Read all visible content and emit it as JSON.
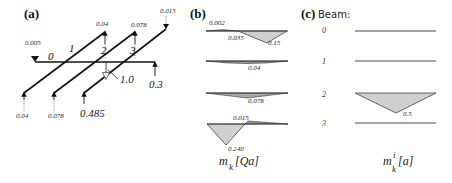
{
  "panels": {
    "a": {
      "label": "(a)",
      "beam_numbers": [
        "0",
        "1",
        "2",
        "3"
      ],
      "load_label": "1.0",
      "top_reactions": [
        "0.005",
        "0.04",
        "0.078",
        "0.015"
      ],
      "bottom_reactions": [
        "0.04",
        "0.078",
        "0.485"
      ],
      "right_reaction": "0.3"
    },
    "b": {
      "label": "(b)",
      "beam_0_values": [
        "0.002",
        "0.035",
        "0.15"
      ],
      "beam_1_values": [
        "0.04"
      ],
      "beam_2_values": [
        "0.078"
      ],
      "beam_3_values": [
        "0.015",
        "0.240"
      ],
      "axis_label_main": "m",
      "axis_label_sub": "k",
      "axis_label_unit": "[Qa]"
    },
    "c": {
      "label": "(c)",
      "title": "Beam:",
      "beam_numbers": [
        "0",
        "1",
        "2",
        "3"
      ],
      "beam_2_value": "0.5",
      "axis_label_main": "m",
      "axis_label_sup": "i",
      "axis_label_sub": "k",
      "axis_label_unit": "[a]"
    }
  }
}
